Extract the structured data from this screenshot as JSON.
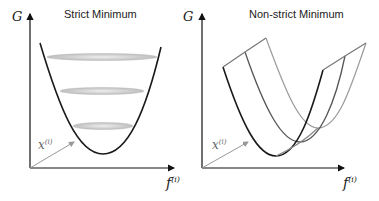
{
  "panels": [
    {
      "title": "Strict Minimum",
      "y_axis_label": "G",
      "x_axis_label": "f",
      "x_axis_superscript": "(i)",
      "depth_axis_label": "x",
      "depth_axis_superscript": "(i)"
    },
    {
      "title": "Non-strict Minimum",
      "y_axis_label": "G",
      "x_axis_label": "f",
      "x_axis_superscript": "(i)",
      "depth_axis_label": "x",
      "depth_axis_superscript": "(i)"
    }
  ],
  "colors": {
    "curve_dark": "#1a1a1a",
    "curve_mid": "#555555",
    "curve_light": "#9a9a9a",
    "ellipse_fill": "#d4d4d4",
    "axis": "#111111",
    "depth_axis": "#999999"
  }
}
